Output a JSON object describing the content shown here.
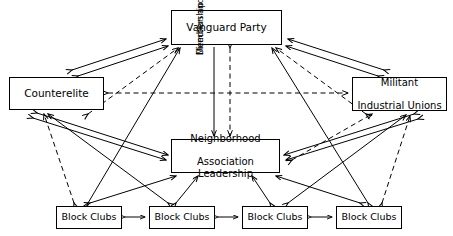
{
  "diagram": {
    "type": "organizational-network-diagram",
    "background_color": "#ffffff",
    "line_color": "#000000",
    "nodes": [
      {
        "id": "vanguard",
        "label": "Vanguard Party",
        "lines": [
          "Vanguard Party"
        ]
      },
      {
        "id": "counterelite",
        "label": "Counterelite",
        "lines": [
          "Counterelite"
        ]
      },
      {
        "id": "unions",
        "label": "Militant Industrial Unions",
        "lines": [
          "Militant",
          "Industrial Unions"
        ]
      },
      {
        "id": "nal",
        "label": "Neighborhood Association Leadership",
        "lines": [
          "Neighborhood",
          "Association Leadership"
        ]
      },
      {
        "id": "block1",
        "label": "Block Clubs",
        "lines": [
          "Block Clubs"
        ]
      },
      {
        "id": "block2",
        "label": "Block Clubs",
        "lines": [
          "Block Clubs"
        ]
      },
      {
        "id": "block3",
        "label": "Block Clubs",
        "lines": [
          "Block Clubs"
        ]
      },
      {
        "id": "block4",
        "label": "Block Clubs",
        "lines": [
          "Block Clubs"
        ]
      }
    ],
    "annotations": [
      {
        "id": "direction-membership",
        "line1": "Direction and",
        "line2": "Membership",
        "orientation": "vertical",
        "text": "Direction and Membership"
      }
    ],
    "edge_styles": {
      "solid": "solid line with arrowheads",
      "dashed": "dashed line with arrowheads"
    }
  }
}
